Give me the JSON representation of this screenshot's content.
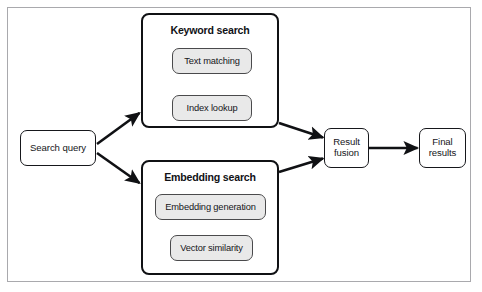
{
  "figure": {
    "frame_color": "#a9a9ad",
    "background": "#ffffff"
  },
  "nodes": {
    "search_query": {
      "label": "Search query"
    },
    "result_fusion": {
      "line1": "Result",
      "line2": "fusion"
    },
    "final_results": {
      "line1": "Final",
      "line2": "results"
    }
  },
  "groups": [
    {
      "id": "keyword-search",
      "title": "Keyword search",
      "steps": [
        {
          "id": "text-matching",
          "label": "Text matching"
        },
        {
          "id": "index-lookup",
          "label": "Index lookup"
        }
      ]
    },
    {
      "id": "embedding-search",
      "title": "Embedding search",
      "steps": [
        {
          "id": "embedding-generation",
          "label": "Embedding generation"
        },
        {
          "id": "vector-similarity",
          "label": "Vector similarity"
        }
      ]
    }
  ],
  "colors": {
    "node_border": "#16171b",
    "step_fill": "#e9e9e9",
    "step_border": "#4a4a4c",
    "group_border": "#101114",
    "arrow": "#101114",
    "text": "#15161a"
  },
  "flows": [
    {
      "from": "search-query",
      "to": "keyword-search"
    },
    {
      "from": "search-query",
      "to": "embedding-search"
    },
    {
      "from": "text-matching",
      "to": "index-lookup"
    },
    {
      "from": "embedding-generation",
      "to": "vector-similarity"
    },
    {
      "from": "keyword-search",
      "to": "result-fusion"
    },
    {
      "from": "embedding-search",
      "to": "result-fusion"
    },
    {
      "from": "result-fusion",
      "to": "final-results"
    }
  ]
}
